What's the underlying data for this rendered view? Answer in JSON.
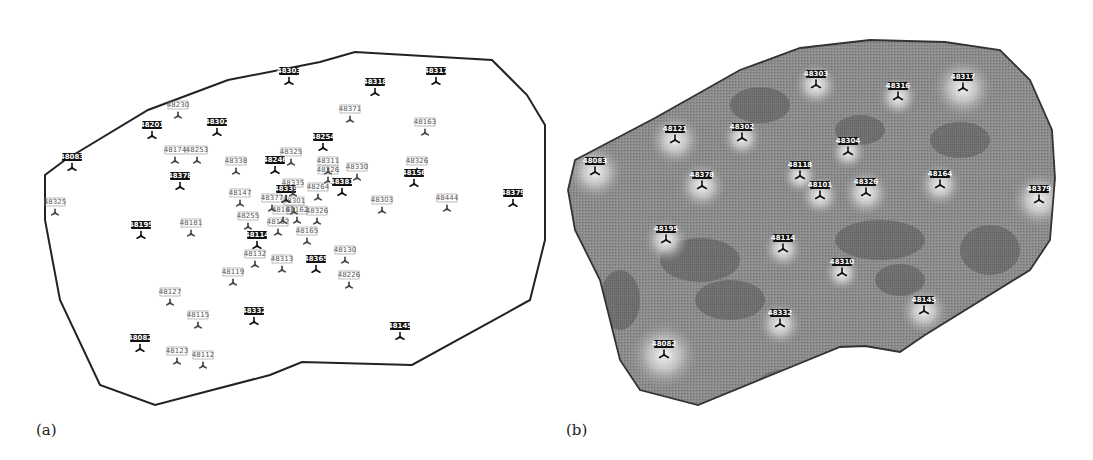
{
  "figure": {
    "panel_a_label": "(a)",
    "panel_b_label": "(b)"
  },
  "colors": {
    "boundary": "#222222",
    "marker": "#111111",
    "surface_base": "#8c8c8c",
    "surface_dark": "#6f6f6f",
    "surface_light": "#e8e8e8",
    "label_box": "#111111",
    "label_text_light": "#ffffff"
  },
  "panel_a": {
    "boundary": "65,160 148,110 228,80 320,62 355,52 492,60 527,95 545,125 545,175 545,240 530,300 412,365 302,362 270,375 155,405 100,385 60,300 45,220 45,175",
    "stations": [
      {
        "label": "48083",
        "x": 72,
        "y": 168,
        "bold": true
      },
      {
        "label": "48325",
        "x": 55,
        "y": 213,
        "bold": false
      },
      {
        "label": "48230",
        "x": 178,
        "y": 116,
        "bold": false
      },
      {
        "label": "48201",
        "x": 152,
        "y": 136,
        "bold": true
      },
      {
        "label": "48302",
        "x": 217,
        "y": 133,
        "bold": true
      },
      {
        "label": "48303",
        "x": 289,
        "y": 82,
        "bold": true
      },
      {
        "label": "48318",
        "x": 375,
        "y": 93,
        "bold": true
      },
      {
        "label": "48317",
        "x": 436,
        "y": 82,
        "bold": true
      },
      {
        "label": "48371",
        "x": 350,
        "y": 120,
        "bold": false
      },
      {
        "label": "48163",
        "x": 425,
        "y": 133,
        "bold": false
      },
      {
        "label": "48254",
        "x": 323,
        "y": 148,
        "bold": true
      },
      {
        "label": "48174",
        "x": 175,
        "y": 161,
        "bold": false
      },
      {
        "label": "48253",
        "x": 197,
        "y": 161,
        "bold": false
      },
      {
        "label": "48378",
        "x": 180,
        "y": 187,
        "bold": true
      },
      {
        "label": "48338",
        "x": 236,
        "y": 172,
        "bold": false
      },
      {
        "label": "48246",
        "x": 275,
        "y": 171,
        "bold": true
      },
      {
        "label": "48325",
        "x": 291,
        "y": 163,
        "bold": false
      },
      {
        "label": "48311",
        "x": 328,
        "y": 172,
        "bold": false
      },
      {
        "label": "48326",
        "x": 328,
        "y": 181,
        "bold": false
      },
      {
        "label": "48330",
        "x": 357,
        "y": 178,
        "bold": false
      },
      {
        "label": "48381",
        "x": 342,
        "y": 193,
        "bold": true
      },
      {
        "label": "48326",
        "x": 417,
        "y": 172,
        "bold": false
      },
      {
        "label": "48156",
        "x": 414,
        "y": 184,
        "bold": true
      },
      {
        "label": "48264",
        "x": 318,
        "y": 198,
        "bold": false
      },
      {
        "label": "48303",
        "x": 382,
        "y": 211,
        "bold": false
      },
      {
        "label": "48444",
        "x": 447,
        "y": 209,
        "bold": false
      },
      {
        "label": "48379",
        "x": 513,
        "y": 204,
        "bold": true
      },
      {
        "label": "48147",
        "x": 240,
        "y": 204,
        "bold": false
      },
      {
        "label": "48339",
        "x": 286,
        "y": 200,
        "bold": true
      },
      {
        "label": "48335",
        "x": 293,
        "y": 194,
        "bold": false
      },
      {
        "label": "48377",
        "x": 272,
        "y": 209,
        "bold": false
      },
      {
        "label": "48301",
        "x": 294,
        "y": 212,
        "bold": false
      },
      {
        "label": "48163",
        "x": 283,
        "y": 221,
        "bold": false
      },
      {
        "label": "48162",
        "x": 297,
        "y": 221,
        "bold": false
      },
      {
        "label": "48326",
        "x": 317,
        "y": 222,
        "bold": false
      },
      {
        "label": "48255",
        "x": 248,
        "y": 227,
        "bold": false
      },
      {
        "label": "48152",
        "x": 278,
        "y": 233,
        "bold": false
      },
      {
        "label": "48165",
        "x": 307,
        "y": 242,
        "bold": false
      },
      {
        "label": "48195",
        "x": 141,
        "y": 236,
        "bold": true
      },
      {
        "label": "48181",
        "x": 191,
        "y": 234,
        "bold": false
      },
      {
        "label": "48114",
        "x": 257,
        "y": 246,
        "bold": true
      },
      {
        "label": "48132",
        "x": 255,
        "y": 265,
        "bold": false
      },
      {
        "label": "48313",
        "x": 282,
        "y": 270,
        "bold": false
      },
      {
        "label": "48365",
        "x": 316,
        "y": 270,
        "bold": true
      },
      {
        "label": "48130",
        "x": 345,
        "y": 261,
        "bold": false
      },
      {
        "label": "48226",
        "x": 349,
        "y": 286,
        "bold": false
      },
      {
        "label": "48119",
        "x": 233,
        "y": 283,
        "bold": false
      },
      {
        "label": "48127",
        "x": 170,
        "y": 303,
        "bold": false
      },
      {
        "label": "48115",
        "x": 198,
        "y": 326,
        "bold": false
      },
      {
        "label": "48332",
        "x": 254,
        "y": 322,
        "bold": true
      },
      {
        "label": "48145",
        "x": 400,
        "y": 337,
        "bold": true
      },
      {
        "label": "48082",
        "x": 140,
        "y": 349,
        "bold": true
      },
      {
        "label": "48123",
        "x": 177,
        "y": 362,
        "bold": false
      },
      {
        "label": "48112",
        "x": 203,
        "y": 366,
        "bold": false
      }
    ]
  },
  "panel_b": {
    "boundary": "575,160 655,118 740,70 800,48 870,40 945,42 1000,50 1030,80 1052,130 1055,178 1050,240 1030,270 925,335 900,352 865,346 840,347 698,405 640,390 620,360 600,280 575,230 568,190",
    "stations": [
      {
        "label": "48083",
        "x": 595,
        "y": 172
      },
      {
        "label": "48121",
        "x": 675,
        "y": 140
      },
      {
        "label": "48302",
        "x": 742,
        "y": 138
      },
      {
        "label": "48303",
        "x": 816,
        "y": 85
      },
      {
        "label": "48316",
        "x": 898,
        "y": 97
      },
      {
        "label": "48317",
        "x": 963,
        "y": 88
      },
      {
        "label": "48304",
        "x": 848,
        "y": 152
      },
      {
        "label": "48118",
        "x": 800,
        "y": 176
      },
      {
        "label": "48101",
        "x": 820,
        "y": 196
      },
      {
        "label": "48326",
        "x": 866,
        "y": 193
      },
      {
        "label": "48164",
        "x": 940,
        "y": 185
      },
      {
        "label": "48378",
        "x": 702,
        "y": 186
      },
      {
        "label": "48379",
        "x": 1039,
        "y": 200
      },
      {
        "label": "48195",
        "x": 666,
        "y": 240
      },
      {
        "label": "48114",
        "x": 783,
        "y": 249
      },
      {
        "label": "48310",
        "x": 842,
        "y": 273
      },
      {
        "label": "48332",
        "x": 780,
        "y": 324
      },
      {
        "label": "48145",
        "x": 924,
        "y": 311
      },
      {
        "label": "48082",
        "x": 664,
        "y": 355
      }
    ],
    "bright_spots": [
      {
        "x": 595,
        "y": 172,
        "r": 28
      },
      {
        "x": 675,
        "y": 140,
        "r": 26
      },
      {
        "x": 742,
        "y": 138,
        "r": 20
      },
      {
        "x": 816,
        "y": 85,
        "r": 22
      },
      {
        "x": 898,
        "y": 97,
        "r": 20
      },
      {
        "x": 963,
        "y": 88,
        "r": 30
      },
      {
        "x": 848,
        "y": 152,
        "r": 18
      },
      {
        "x": 800,
        "y": 176,
        "r": 18
      },
      {
        "x": 820,
        "y": 196,
        "r": 20
      },
      {
        "x": 866,
        "y": 193,
        "r": 24
      },
      {
        "x": 940,
        "y": 185,
        "r": 22
      },
      {
        "x": 702,
        "y": 186,
        "r": 24
      },
      {
        "x": 1039,
        "y": 200,
        "r": 28
      },
      {
        "x": 666,
        "y": 240,
        "r": 22
      },
      {
        "x": 783,
        "y": 249,
        "r": 20
      },
      {
        "x": 842,
        "y": 273,
        "r": 18
      },
      {
        "x": 780,
        "y": 324,
        "r": 22
      },
      {
        "x": 924,
        "y": 311,
        "r": 24
      },
      {
        "x": 664,
        "y": 355,
        "r": 34
      }
    ],
    "dark_patches": [
      {
        "x": 700,
        "y": 260,
        "rx": 40,
        "ry": 22
      },
      {
        "x": 880,
        "y": 240,
        "rx": 45,
        "ry": 20
      },
      {
        "x": 760,
        "y": 105,
        "rx": 30,
        "ry": 18
      },
      {
        "x": 990,
        "y": 250,
        "rx": 30,
        "ry": 25
      },
      {
        "x": 730,
        "y": 300,
        "rx": 35,
        "ry": 20
      },
      {
        "x": 860,
        "y": 130,
        "rx": 25,
        "ry": 15
      },
      {
        "x": 620,
        "y": 300,
        "rx": 20,
        "ry": 30
      },
      {
        "x": 960,
        "y": 140,
        "rx": 30,
        "ry": 18
      },
      {
        "x": 800,
        "y": 380,
        "rx": 40,
        "ry": 12
      },
      {
        "x": 900,
        "y": 280,
        "rx": 25,
        "ry": 16
      }
    ]
  }
}
